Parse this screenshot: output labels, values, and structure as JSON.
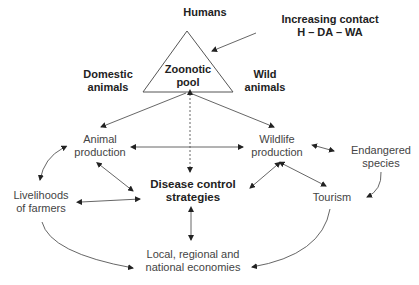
{
  "diagram": {
    "title_nodes": {
      "humans": "Humans",
      "contact_line1": "Increasing contact",
      "contact_line2": "H – DA – WA",
      "domestic_line1": "Domestic",
      "domestic_line2": "animals",
      "wild_line1": "Wild",
      "wild_line2": "animals",
      "pool_line1": "Zoonotic",
      "pool_line2": "pool"
    },
    "nodes": {
      "animal_production": [
        "Animal",
        "production"
      ],
      "wildlife_production": [
        "Wildlife",
        "production"
      ],
      "endangered_species": [
        "Endangered",
        "species"
      ],
      "livelihoods": [
        "Livelihoods",
        "of farmers"
      ],
      "disease_control": [
        "Disease control",
        "strategies"
      ],
      "tourism": [
        "Tourism"
      ],
      "economies": [
        "Local, regional and",
        "national economies"
      ]
    },
    "edges": [
      {
        "from": "increasing_contact",
        "to": "zoonotic_pool",
        "type": "arrow"
      },
      {
        "from": "zoonotic_pool",
        "to": "animal_production",
        "type": "arrow"
      },
      {
        "from": "zoonotic_pool",
        "to": "wildlife_production",
        "type": "arrow"
      },
      {
        "from": "zoonotic_pool",
        "to": "disease_control",
        "type": "dotted-bidirectional"
      },
      {
        "from": "animal_production",
        "to": "wildlife_production",
        "type": "bidirectional"
      },
      {
        "from": "animal_production",
        "to": "disease_control",
        "type": "bidirectional"
      },
      {
        "from": "animal_production",
        "to": "livelihoods",
        "type": "curved-bidirectional"
      },
      {
        "from": "wildlife_production",
        "to": "endangered_species",
        "type": "bidirectional"
      },
      {
        "from": "wildlife_production",
        "to": "disease_control",
        "type": "bidirectional"
      },
      {
        "from": "wildlife_production",
        "to": "tourism",
        "type": "bidirectional"
      },
      {
        "from": "endangered_species",
        "to": "tourism",
        "type": "curved-arrow"
      },
      {
        "from": "livelihoods",
        "to": "disease_control",
        "type": "bidirectional"
      },
      {
        "from": "disease_control",
        "to": "economies",
        "type": "bidirectional"
      },
      {
        "from": "livelihoods",
        "to": "economies",
        "type": "curved-arrow"
      },
      {
        "from": "tourism",
        "to": "economies",
        "type": "curved-arrow"
      }
    ]
  }
}
